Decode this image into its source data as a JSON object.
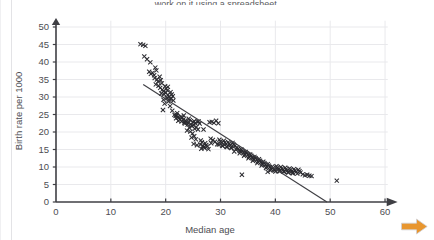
{
  "page": {
    "caption_clipped": "work on it using a spreadsheet.",
    "background_color": "#ffffff"
  },
  "next_arrow": {
    "icon": "arrow-right-icon",
    "color": "#e8962f"
  },
  "chart_data": {
    "type": "scatter",
    "title": "",
    "xlabel": "Median age",
    "ylabel": "Birth rate per 1000",
    "xlim": [
      0,
      62
    ],
    "ylim": [
      0,
      52
    ],
    "xticks": [
      0,
      10,
      20,
      30,
      40,
      50,
      60
    ],
    "yticks": [
      0,
      5,
      10,
      15,
      20,
      25,
      30,
      35,
      40,
      45,
      50
    ],
    "xtick_labels": [
      "0",
      "10",
      "20",
      "30",
      "40",
      "50",
      "60"
    ],
    "ytick_labels": [
      "0",
      "5",
      "10",
      "15",
      "20",
      "25",
      "30",
      "35",
      "40",
      "45",
      "50"
    ],
    "grid": true,
    "grid_color": "#e9e9ec",
    "axis_color": "#3f3f44",
    "axis_arrows": true,
    "marker": "x-cross",
    "marker_color": "#2b2b30",
    "marker_size": 4.2,
    "legend": null,
    "trend_line": {
      "type": "linear-fit",
      "color": "#3f3f44",
      "x_start": 15.9,
      "y_start": 33.6,
      "x_end": 49.4,
      "y_end": 0.0,
      "slope": -1.003,
      "intercept": 49.56
    },
    "annotations": [],
    "points": [
      [
        15.4,
        45.1
      ],
      [
        15.9,
        44.9
      ],
      [
        16.3,
        44.6
      ],
      [
        16.1,
        41.6
      ],
      [
        16.6,
        40.8
      ],
      [
        17.2,
        39.9
      ],
      [
        17.0,
        37.2
      ],
      [
        17.3,
        36.6
      ],
      [
        17.6,
        36.9
      ],
      [
        17.9,
        36.2
      ],
      [
        18.1,
        38.4
      ],
      [
        18.3,
        37.6
      ],
      [
        18.0,
        35.4
      ],
      [
        18.4,
        35.0
      ],
      [
        18.6,
        34.4
      ],
      [
        18.2,
        33.6
      ],
      [
        18.7,
        33.2
      ],
      [
        18.9,
        35.8
      ],
      [
        19.1,
        34.8
      ],
      [
        19.3,
        33.9
      ],
      [
        19.0,
        32.6
      ],
      [
        19.4,
        32.1
      ],
      [
        19.6,
        31.6
      ],
      [
        19.2,
        31.0
      ],
      [
        19.7,
        30.8
      ],
      [
        19.9,
        33.1
      ],
      [
        20.1,
        32.4
      ],
      [
        20.3,
        31.9
      ],
      [
        20.0,
        31.2
      ],
      [
        20.4,
        30.6
      ],
      [
        20.6,
        30.1
      ],
      [
        20.2,
        29.7
      ],
      [
        20.7,
        29.4
      ],
      [
        20.9,
        31.4
      ],
      [
        21.1,
        30.7
      ],
      [
        21.3,
        30.2
      ],
      [
        21.0,
        29.5
      ],
      [
        21.4,
        29.0
      ],
      [
        20.5,
        28.7
      ],
      [
        19.8,
        28.1
      ],
      [
        19.5,
        26.3
      ],
      [
        20.8,
        27.4
      ],
      [
        21.6,
        24.9
      ],
      [
        21.8,
        24.6
      ],
      [
        22.0,
        24.8
      ],
      [
        22.2,
        24.3
      ],
      [
        21.9,
        23.9
      ],
      [
        22.4,
        24.1
      ],
      [
        22.6,
        23.6
      ],
      [
        22.3,
        23.2
      ],
      [
        22.8,
        24.4
      ],
      [
        23.0,
        24.0
      ],
      [
        23.2,
        23.5
      ],
      [
        22.9,
        23.0
      ],
      [
        23.4,
        22.7
      ],
      [
        23.6,
        23.3
      ],
      [
        23.8,
        22.9
      ],
      [
        23.5,
        22.4
      ],
      [
        24.0,
        22.1
      ],
      [
        24.2,
        23.8
      ],
      [
        24.4,
        23.4
      ],
      [
        24.1,
        22.6
      ],
      [
        24.6,
        22.2
      ],
      [
        24.8,
        21.7
      ],
      [
        24.3,
        21.2
      ],
      [
        25.0,
        22.8
      ],
      [
        25.2,
        23.1
      ],
      [
        25.4,
        22.5
      ],
      [
        25.1,
        21.9
      ],
      [
        25.6,
        21.4
      ],
      [
        25.3,
        20.9
      ],
      [
        23.9,
        20.4
      ],
      [
        24.5,
        20.1
      ],
      [
        25.8,
        22.9
      ],
      [
        26.0,
        23.0
      ],
      [
        26.2,
        22.4
      ],
      [
        25.9,
        20.7
      ],
      [
        24.7,
        18.4
      ],
      [
        25.5,
        17.9
      ],
      [
        25.1,
        16.6
      ],
      [
        25.7,
        16.2
      ],
      [
        26.4,
        17.6
      ],
      [
        26.6,
        17.1
      ],
      [
        26.3,
        16.4
      ],
      [
        26.8,
        16.0
      ],
      [
        27.0,
        15.7
      ],
      [
        26.5,
        15.2
      ],
      [
        27.2,
        16.8
      ],
      [
        27.4,
        16.3
      ],
      [
        27.6,
        15.9
      ],
      [
        27.1,
        15.4
      ],
      [
        27.8,
        15.1
      ],
      [
        28.0,
        22.8
      ],
      [
        28.4,
        22.9
      ],
      [
        28.8,
        22.6
      ],
      [
        29.2,
        23.2
      ],
      [
        29.6,
        22.5
      ],
      [
        28.2,
        18.1
      ],
      [
        28.6,
        17.7
      ],
      [
        29.0,
        17.2
      ],
      [
        28.3,
        16.8
      ],
      [
        29.4,
        16.5
      ],
      [
        29.8,
        17.8
      ],
      [
        30.0,
        17.3
      ],
      [
        30.2,
        16.9
      ],
      [
        29.7,
        16.4
      ],
      [
        30.4,
        16.0
      ],
      [
        30.6,
        17.5
      ],
      [
        30.8,
        17.0
      ],
      [
        31.0,
        16.6
      ],
      [
        30.3,
        16.1
      ],
      [
        31.2,
        15.7
      ],
      [
        31.4,
        17.1
      ],
      [
        31.6,
        16.7
      ],
      [
        31.8,
        16.2
      ],
      [
        31.1,
        15.8
      ],
      [
        32.0,
        15.4
      ],
      [
        32.2,
        16.9
      ],
      [
        32.4,
        16.4
      ],
      [
        32.6,
        16.0
      ],
      [
        31.9,
        15.5
      ],
      [
        32.8,
        15.1
      ],
      [
        33.0,
        15.6
      ],
      [
        33.2,
        15.2
      ],
      [
        33.4,
        14.8
      ],
      [
        32.5,
        14.4
      ],
      [
        33.6,
        14.5
      ],
      [
        33.8,
        15.0
      ],
      [
        34.0,
        14.6
      ],
      [
        34.2,
        14.2
      ],
      [
        33.5,
        13.9
      ],
      [
        34.4,
        13.6
      ],
      [
        34.6,
        14.3
      ],
      [
        34.8,
        13.9
      ],
      [
        35.0,
        13.5
      ],
      [
        34.3,
        13.2
      ],
      [
        35.2,
        12.9
      ],
      [
        35.4,
        13.6
      ],
      [
        35.6,
        13.2
      ],
      [
        35.8,
        12.8
      ],
      [
        35.1,
        12.5
      ],
      [
        36.0,
        12.2
      ],
      [
        36.2,
        12.9
      ],
      [
        36.4,
        12.5
      ],
      [
        36.6,
        12.1
      ],
      [
        35.9,
        11.8
      ],
      [
        36.8,
        11.5
      ],
      [
        37.0,
        12.2
      ],
      [
        37.2,
        11.8
      ],
      [
        37.4,
        11.4
      ],
      [
        36.7,
        11.1
      ],
      [
        37.6,
        10.8
      ],
      [
        37.8,
        11.5
      ],
      [
        38.0,
        11.1
      ],
      [
        38.2,
        10.7
      ],
      [
        37.5,
        10.4
      ],
      [
        38.4,
        10.1
      ],
      [
        38.6,
        10.8
      ],
      [
        38.8,
        10.4
      ],
      [
        39.0,
        10.0
      ],
      [
        38.3,
        9.7
      ],
      [
        39.2,
        9.4
      ],
      [
        39.4,
        10.1
      ],
      [
        39.6,
        9.7
      ],
      [
        39.8,
        9.3
      ],
      [
        39.1,
        9.0
      ],
      [
        40.0,
        8.7
      ],
      [
        40.2,
        10.2
      ],
      [
        40.4,
        9.8
      ],
      [
        40.6,
        9.4
      ],
      [
        39.9,
        9.1
      ],
      [
        40.8,
        8.8
      ],
      [
        41.0,
        10.0
      ],
      [
        41.2,
        9.6
      ],
      [
        41.4,
        9.2
      ],
      [
        40.7,
        8.9
      ],
      [
        41.6,
        8.6
      ],
      [
        41.8,
        9.8
      ],
      [
        42.0,
        9.4
      ],
      [
        42.2,
        9.0
      ],
      [
        41.5,
        8.7
      ],
      [
        42.4,
        8.4
      ],
      [
        42.6,
        9.6
      ],
      [
        42.8,
        9.2
      ],
      [
        43.0,
        8.8
      ],
      [
        42.3,
        8.5
      ],
      [
        43.2,
        8.2
      ],
      [
        43.4,
        9.4
      ],
      [
        43.6,
        9.0
      ],
      [
        43.8,
        8.6
      ],
      [
        43.1,
        8.3
      ],
      [
        44.0,
        8.1
      ],
      [
        44.2,
        9.2
      ],
      [
        44.4,
        8.8
      ],
      [
        44.6,
        8.4
      ],
      [
        45.0,
        7.9
      ],
      [
        45.4,
        7.6
      ],
      [
        45.8,
        7.8
      ],
      [
        46.2,
        7.5
      ],
      [
        46.6,
        7.4
      ],
      [
        33.9,
        7.8
      ],
      [
        38.6,
        8.6
      ],
      [
        26.9,
        20.7
      ],
      [
        24.9,
        19.6
      ],
      [
        25.2,
        18.8
      ],
      [
        21.2,
        26.1
      ],
      [
        19.6,
        29.2
      ],
      [
        20.4,
        32.9
      ],
      [
        22.1,
        25.4
      ],
      [
        23.3,
        24.7
      ],
      [
        51.2,
        6.1
      ]
    ]
  }
}
